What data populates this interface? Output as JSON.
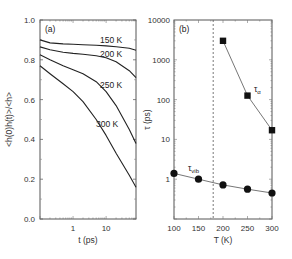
{
  "chart_data": [
    {
      "type": "line",
      "panel_label": "(a)",
      "title": "",
      "xlabel": "t (ps)",
      "ylabel": "<h(0)h(t)>/<h>",
      "xscale": "log",
      "xlim": [
        0.1,
        80
      ],
      "ylim": [
        0.0,
        1.0
      ],
      "xticks": [
        {
          "value": 1,
          "label": "1"
        },
        {
          "value": 10,
          "label": "10"
        }
      ],
      "yticks": [
        {
          "value": 0.0,
          "label": "0.0"
        },
        {
          "value": 0.2,
          "label": "0.2"
        },
        {
          "value": 0.4,
          "label": "0.4"
        },
        {
          "value": 0.6,
          "label": "0.6"
        },
        {
          "value": 0.8,
          "label": "0.8"
        },
        {
          "value": 1.0,
          "label": "1.0"
        }
      ],
      "grid": false,
      "series": [
        {
          "name": "150 K",
          "x": [
            0.1,
            0.2,
            0.5,
            1,
            2,
            5,
            10,
            20,
            50,
            80
          ],
          "values": [
            0.9,
            0.885,
            0.88,
            0.878,
            0.876,
            0.873,
            0.87,
            0.866,
            0.858,
            0.848
          ]
        },
        {
          "name": "200 K",
          "x": [
            0.1,
            0.2,
            0.5,
            1,
            2,
            5,
            10,
            20,
            50,
            80
          ],
          "values": [
            0.865,
            0.85,
            0.838,
            0.832,
            0.828,
            0.82,
            0.81,
            0.79,
            0.745,
            0.71
          ]
        },
        {
          "name": "250 K",
          "x": [
            0.1,
            0.2,
            0.5,
            1,
            2,
            5,
            10,
            20,
            50,
            80
          ],
          "values": [
            0.825,
            0.8,
            0.77,
            0.75,
            0.73,
            0.69,
            0.64,
            0.57,
            0.45,
            0.38
          ]
        },
        {
          "name": "300 K",
          "x": [
            0.1,
            0.2,
            0.5,
            1,
            2,
            5,
            10,
            20,
            50,
            80
          ],
          "values": [
            0.77,
            0.73,
            0.68,
            0.64,
            0.59,
            0.5,
            0.42,
            0.33,
            0.22,
            0.16
          ]
        }
      ]
    },
    {
      "type": "scatter",
      "panel_label": "(b)",
      "title": "",
      "xlabel": "T (K)",
      "ylabel": "τ (ps)",
      "yscale": "log",
      "xlim": [
        100,
        300
      ],
      "ylim": [
        0.1,
        10000
      ],
      "xticks": [
        {
          "value": 100,
          "label": "100"
        },
        {
          "value": 150,
          "label": "150"
        },
        {
          "value": 200,
          "label": "200"
        },
        {
          "value": 250,
          "label": "250"
        },
        {
          "value": 300,
          "label": "300"
        }
      ],
      "yticks": [
        {
          "value": 1,
          "label": "1"
        },
        {
          "value": 10,
          "label": "10"
        },
        {
          "value": 100,
          "label": "100"
        },
        {
          "value": 1000,
          "label": "1000"
        },
        {
          "value": 10000,
          "label": "10000"
        }
      ],
      "annotations": [
        {
          "type": "vertical-dashed-line",
          "x": 180
        }
      ],
      "grid": false,
      "series": [
        {
          "name": "τα",
          "marker": "square",
          "x": [
            200,
            250,
            300
          ],
          "values": [
            3000,
            126,
            17
          ]
        },
        {
          "name": "τvib",
          "marker": "circle",
          "x": [
            100,
            150,
            200,
            250,
            300
          ],
          "values": [
            1.4,
            1.0,
            0.72,
            0.56,
            0.45
          ]
        }
      ]
    }
  ]
}
